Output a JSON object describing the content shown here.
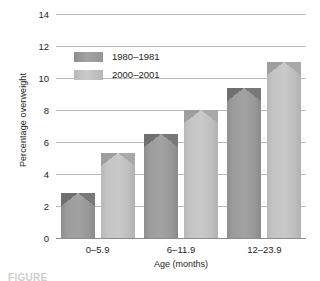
{
  "chart_data": {
    "type": "bar",
    "title": "",
    "xlabel": "Age (months)",
    "ylabel": "Percentage overweight",
    "categories": [
      "0–5.9",
      "6–11.9",
      "12–23.9"
    ],
    "series": [
      {
        "name": "1980–1981",
        "values": [
          2.8,
          6.5,
          9.4
        ],
        "color": "#9c9c9c"
      },
      {
        "name": "2000–2001",
        "values": [
          5.3,
          8.0,
          11.0
        ],
        "color": "#c4c4c4"
      }
    ],
    "ylim": [
      0,
      14
    ],
    "yticks": [
      0,
      2,
      4,
      6,
      8,
      10,
      12,
      14
    ],
    "ytick_labels": [
      "0",
      "2",
      "4",
      "6",
      "8",
      "10",
      "12",
      "14"
    ],
    "grid": true,
    "grid_axis": "y",
    "legend_position": "upper left"
  },
  "figure": {
    "caption_fragment": "FIGURE"
  }
}
